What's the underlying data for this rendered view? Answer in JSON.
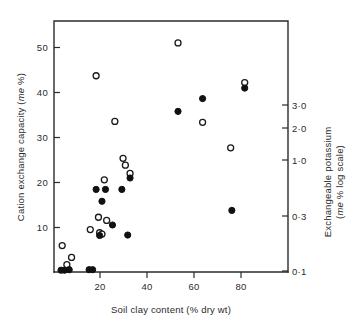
{
  "chart_data": {
    "type": "scatter",
    "title": "",
    "xlabel": "Soil clay content (% dry wt)",
    "ylabel_left_line1": "Cation exchange capacity (",
    "ylabel_left_italic": "me",
    "ylabel_left_line2": " %)",
    "ylabel_left_full": "Cation exchange capacity (me %)",
    "ylabel_right_line1": "Exchangeable  potassium",
    "ylabel_right_line2_pre": "(",
    "ylabel_right_line2_italic": "me",
    "ylabel_right_line2_post": " % log scale)",
    "ylabel_right_full": "Exchangeable potassium (me % log scale)",
    "xlim": [
      0,
      100
    ],
    "ylim_left": [
      0,
      55
    ],
    "xticks": [
      20,
      40,
      60,
      80
    ],
    "xticklabels": [
      "20",
      "40",
      "60",
      "80"
    ],
    "yticks_left": [
      10,
      20,
      30,
      40,
      50
    ],
    "yticklabels_left": [
      "10",
      "20",
      "30",
      "40",
      "50"
    ],
    "yticks_right_values": [
      0.1,
      0.3,
      1.0,
      2.0,
      3.0
    ],
    "yticklabels_right": [
      "3·0",
      "2·0",
      "1·0",
      "0·3",
      "0·1"
    ],
    "yticks_right_pixel_y": [
      105,
      128,
      160,
      216,
      268
    ],
    "right_axis_scale": "log",
    "grid": false,
    "legend": null,
    "series": [
      {
        "name": "Cation exchange capacity",
        "marker": "open-circle",
        "marker_color": "#ffffff",
        "marker_edge_color": "#1a1a1a",
        "points": [
          [
            3.5,
            5.8
          ],
          [
            5.5,
            1.6
          ],
          [
            7.5,
            3.2
          ],
          [
            15.5,
            9.3
          ],
          [
            18.0,
            43.0
          ],
          [
            19.0,
            12.0
          ],
          [
            19.5,
            8.6
          ],
          [
            20.5,
            8.3
          ],
          [
            21.5,
            20.2
          ],
          [
            22.5,
            11.3
          ],
          [
            26.0,
            33.0
          ],
          [
            29.5,
            24.9
          ],
          [
            30.5,
            23.4
          ],
          [
            32.5,
            21.6
          ],
          [
            53.0,
            50.2
          ],
          [
            63.5,
            32.8
          ],
          [
            75.5,
            27.2
          ],
          [
            81.5,
            41.5
          ]
        ]
      },
      {
        "name": "Exchangeable potassium",
        "marker": "filled-circle",
        "marker_color": "#111111",
        "marker_edge_color": "#111111",
        "points": [
          [
            3.0,
            0.4
          ],
          [
            4.5,
            0.4
          ],
          [
            6.5,
            0.5
          ],
          [
            15.0,
            0.5
          ],
          [
            16.5,
            0.5
          ],
          [
            18.0,
            18.1
          ],
          [
            19.5,
            8.0
          ],
          [
            20.5,
            15.5
          ],
          [
            22.0,
            18.1
          ],
          [
            25.0,
            10.3
          ],
          [
            29.0,
            18.1
          ],
          [
            31.5,
            8.1
          ],
          [
            32.5,
            20.6
          ],
          [
            53.0,
            35.2
          ],
          [
            63.5,
            38.0
          ],
          [
            76.0,
            13.5
          ],
          [
            81.5,
            40.3
          ]
        ]
      }
    ]
  },
  "axes_geometry": {
    "plot_left_px": 54,
    "plot_right_px": 288,
    "plot_top_px": 21,
    "plot_bottom_px": 272
  }
}
